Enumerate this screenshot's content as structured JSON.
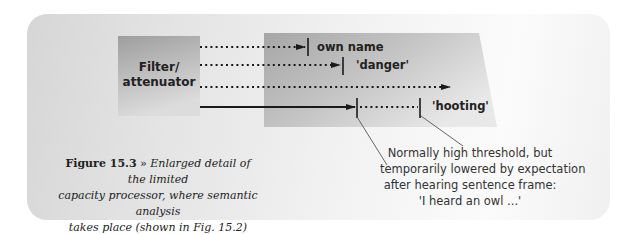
{
  "diagram": {
    "filter_box": {
      "label_line1": "Filter/",
      "label_line2": "attenuator"
    },
    "processor": {
      "channels": [
        {
          "type": "dotted",
          "threshold_label": "own name"
        },
        {
          "type": "dotted",
          "threshold_label": "'danger'"
        },
        {
          "type": "dotted",
          "threshold_label": ""
        },
        {
          "type": "solid",
          "threshold_label": "'hooting'"
        }
      ]
    },
    "annotation": {
      "line1": "Normally high threshold, but",
      "line2": "temporarily lowered by expectation",
      "line3": "after hearing sentence frame:",
      "line4": "'I heard an owl ...'"
    },
    "caption": {
      "figure_number": "Figure 15.3",
      "separator": " » ",
      "line1": "Enlarged detail of the limited",
      "line2": "capacity processor, where semantic analysis",
      "line3": "takes place (shown in Fig. 15.2)"
    },
    "colors": {
      "box_fill_dark": "#a8a8a8",
      "box_fill_light": "#e6e6e6",
      "line": "#1a1a1a",
      "leader": "#555555"
    }
  }
}
